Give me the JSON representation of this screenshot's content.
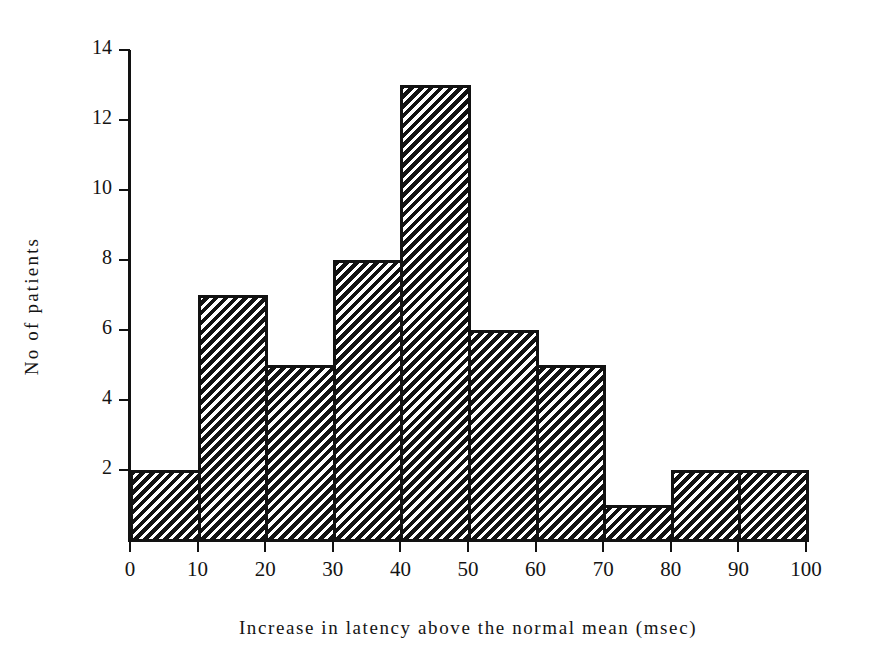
{
  "chart_data": {
    "type": "bar",
    "title": "",
    "subtitle": "",
    "xlabel": "Increase in latency above the normal mean (msec)",
    "ylabel": "No of patients",
    "categories": [
      "0-10",
      "10-20",
      "20-30",
      "30-40",
      "40-50",
      "50-60",
      "60-70",
      "70-80",
      "80-90",
      "90-100"
    ],
    "bin_edges": [
      0,
      10,
      20,
      30,
      40,
      50,
      60,
      70,
      80,
      90,
      100
    ],
    "values": [
      2,
      7,
      5,
      8,
      13,
      6,
      5,
      1,
      2,
      2
    ],
    "xticks": [
      "0",
      "10",
      "20",
      "30",
      "40",
      "50",
      "60",
      "70",
      "80",
      "90",
      "100"
    ],
    "xtick_values": [
      0,
      10,
      20,
      30,
      40,
      50,
      60,
      70,
      80,
      90,
      100
    ],
    "yticks": [
      "2",
      "4",
      "6",
      "8",
      "10",
      "12",
      "14"
    ],
    "ytick_values": [
      2,
      4,
      6,
      8,
      10,
      12,
      14
    ],
    "xlim": [
      0,
      100
    ],
    "ylim": [
      0,
      14
    ],
    "grid": false,
    "legend": null,
    "bar_fill": "diagonal-hatch",
    "bar_edge_color": "#121212",
    "background_color": "#ffffff",
    "total_patients": 51
  },
  "axes": {
    "y_axis_label": "No of patients",
    "x_axis_label": "Increase in latency above the normal mean (msec)"
  }
}
